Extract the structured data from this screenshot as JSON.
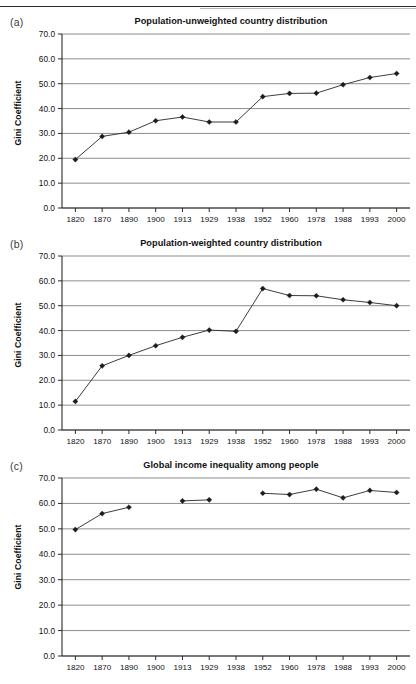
{
  "page": {
    "has_top_rule": true,
    "background": "#ffffff",
    "ink": "#1a1a1a"
  },
  "axis": {
    "ylabel": "Gini Coefficient",
    "yticks": [
      "0.0",
      "10.0",
      "20.0",
      "30.0",
      "40.0",
      "50.0",
      "60.0",
      "70.0"
    ],
    "xticks": [
      "1820",
      "1870",
      "1890",
      "1900",
      "1913",
      "1929",
      "1938",
      "1952",
      "1960",
      "1978",
      "1988",
      "1993",
      "2000"
    ]
  },
  "panels": [
    {
      "letter": "(a)",
      "title": "Population-unweighted country distribution"
    },
    {
      "letter": "(b)",
      "title": "Population-weighted country distribution"
    },
    {
      "letter": "(c)",
      "title": "Global income inequality among people"
    }
  ],
  "chart_data": [
    {
      "type": "line",
      "panel": "(a)",
      "title": "Population-unweighted country distribution",
      "xlabel": "",
      "ylabel": "Gini Coefficient",
      "categories": [
        "1820",
        "1870",
        "1890",
        "1900",
        "1913",
        "1929",
        "1938",
        "1952",
        "1960",
        "1978",
        "1988",
        "1993",
        "2000"
      ],
      "values": [
        19.5,
        28.8,
        30.5,
        35.1,
        36.6,
        34.6,
        34.6,
        44.8,
        46.1,
        46.2,
        49.6,
        52.5,
        54.1
      ],
      "ylim": [
        0.0,
        70.0
      ],
      "ytick_step": 10.0,
      "grid": "horizontal",
      "legend": "none",
      "marker": "diamond",
      "line_color": "#333333",
      "marker_color": "#1c1c1c"
    },
    {
      "type": "line",
      "panel": "(b)",
      "title": "Population-weighted country distribution",
      "xlabel": "",
      "ylabel": "Gini Coefficient",
      "categories": [
        "1820",
        "1870",
        "1890",
        "1900",
        "1913",
        "1929",
        "1938",
        "1952",
        "1960",
        "1978",
        "1988",
        "1993",
        "2000"
      ],
      "values": [
        11.5,
        25.8,
        30.0,
        33.9,
        37.3,
        40.2,
        39.7,
        56.9,
        54.1,
        54.0,
        52.4,
        51.3,
        50.0
      ],
      "ylim": [
        0.0,
        70.0
      ],
      "ytick_step": 10.0,
      "grid": "horizontal",
      "legend": "none",
      "marker": "diamond",
      "line_color": "#333333",
      "marker_color": "#1c1c1c"
    },
    {
      "type": "line",
      "panel": "(c)",
      "title": "Global income inequality among people",
      "xlabel": "",
      "ylabel": "Gini Coefficient",
      "categories": [
        "1820",
        "1870",
        "1890",
        "1900",
        "1913",
        "1929",
        "1938",
        "1952",
        "1960",
        "1978",
        "1988",
        "1993",
        "2000"
      ],
      "values": [
        49.7,
        56.0,
        58.5,
        null,
        61.0,
        61.4,
        null,
        64.0,
        63.5,
        65.6,
        62.2,
        65.1,
        64.3
      ],
      "ylim": [
        0.0,
        70.0
      ],
      "ytick_step": 10.0,
      "grid": "horizontal",
      "legend": "none",
      "marker": "diamond",
      "line_color": "#333333",
      "marker_color": "#1c1c1c",
      "note": "no data at 1900 and 1938"
    }
  ]
}
